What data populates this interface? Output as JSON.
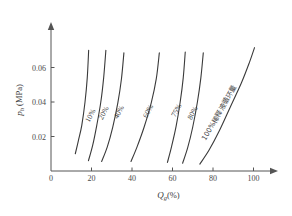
{
  "chart_data": {
    "type": "line",
    "title": "",
    "xlabel": "Qg(%)",
    "xlabel_main": "Q",
    "xlabel_sub": "g",
    "xlabel_unit": "(%)",
    "ylabel": "ph (MPa)",
    "ylabel_main": "p",
    "ylabel_sub": "h",
    "ylabel_unit": " (MPa)",
    "xlim": [
      0,
      110
    ],
    "ylim": [
      0,
      0.078
    ],
    "xticks": [
      0,
      20,
      40,
      60,
      80,
      100
    ],
    "xtick_labels": [
      "0",
      "20",
      "40",
      "60",
      "80",
      "100"
    ],
    "yticks": [
      0.02,
      0.04,
      0.06
    ],
    "ytick_labels": [
      "0.02",
      "0.04",
      "0.06"
    ],
    "grid": false,
    "legend_position": "inline-curve-labels",
    "axis_color": "#555555",
    "curve_color": "#3a3a3a",
    "series": [
      {
        "name": "10%",
        "label": "10%",
        "label_x": 20.5,
        "label_y": 0.0315,
        "label_rotation": -62,
        "points": [
          [
            12.0,
            0.01
          ],
          [
            13.5,
            0.0175
          ],
          [
            15.2,
            0.0265
          ],
          [
            16.8,
            0.04
          ],
          [
            17.9,
            0.054
          ],
          [
            18.6,
            0.07
          ]
        ]
      },
      {
        "name": "20%",
        "label": "20%",
        "label_x": 27.0,
        "label_y": 0.033,
        "label_rotation": -62,
        "points": [
          [
            18.5,
            0.006
          ],
          [
            20.6,
            0.015
          ],
          [
            22.6,
            0.0265
          ],
          [
            24.6,
            0.04
          ],
          [
            26.0,
            0.054
          ],
          [
            27.1,
            0.07
          ]
        ]
      },
      {
        "name": "40%",
        "label": "40%",
        "label_x": 34.5,
        "label_y": 0.0335,
        "label_rotation": -62,
        "points": [
          [
            25.0,
            0.0055
          ],
          [
            27.8,
            0.014
          ],
          [
            30.5,
            0.0255
          ],
          [
            33.0,
            0.0395
          ],
          [
            34.8,
            0.0535
          ],
          [
            36.0,
            0.0685
          ]
        ]
      },
      {
        "name": "60%",
        "label": "60%",
        "label_x": 49.0,
        "label_y": 0.034,
        "label_rotation": -62,
        "points": [
          [
            39.5,
            0.0055
          ],
          [
            42.5,
            0.014
          ],
          [
            46.0,
            0.0255
          ],
          [
            49.5,
            0.0395
          ],
          [
            52.0,
            0.0535
          ],
          [
            53.5,
            0.0685
          ]
        ]
      },
      {
        "name": "75%",
        "label": "75%",
        "label_x": 63.0,
        "label_y": 0.0345,
        "label_rotation": -62,
        "points": [
          [
            57.5,
            0.005
          ],
          [
            59.5,
            0.014
          ],
          [
            61.8,
            0.026
          ],
          [
            63.8,
            0.04
          ],
          [
            65.3,
            0.054
          ],
          [
            66.3,
            0.069
          ]
        ]
      },
      {
        "name": "80%",
        "label": "80%",
        "label_x": 71.0,
        "label_y": 0.033,
        "label_rotation": -62,
        "points": [
          [
            65.0,
            0.0045
          ],
          [
            67.5,
            0.0135
          ],
          [
            70.0,
            0.0255
          ],
          [
            72.3,
            0.04
          ],
          [
            74.0,
            0.054
          ],
          [
            75.2,
            0.0685
          ]
        ]
      },
      {
        "name": "100%稀释液循环量",
        "label": "100%稀释液循环量",
        "label_x": 84.0,
        "label_y": 0.033,
        "label_rotation": -60,
        "points": [
          [
            73.5,
            0.004
          ],
          [
            78.0,
            0.012
          ],
          [
            83.0,
            0.023
          ],
          [
            88.5,
            0.037
          ],
          [
            94.0,
            0.051
          ],
          [
            98.0,
            0.063
          ],
          [
            100.5,
            0.0715
          ]
        ]
      }
    ]
  }
}
